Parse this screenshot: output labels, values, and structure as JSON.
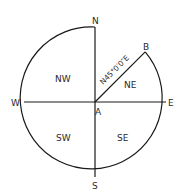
{
  "diagram": {
    "type": "bearing-compass",
    "center_point": "A",
    "target_point": "B",
    "compass_labels": {
      "north": "N",
      "south": "S",
      "east": "E",
      "west": "W"
    },
    "quadrants": {
      "ne": "NE",
      "nw": "NW",
      "sw": "SW",
      "se": "SE"
    },
    "bearing_label": "N45°0′0″E",
    "stroke_color": "#1a1a1a",
    "text_color": "#2a2a2a"
  }
}
